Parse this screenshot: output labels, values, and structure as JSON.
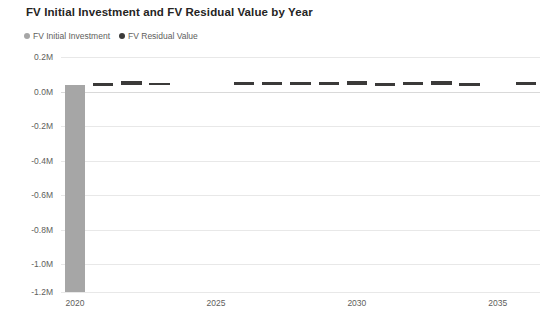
{
  "chart_data": {
    "type": "bar",
    "title": "FV Initial Investment and FV Residual Value by Year",
    "xlabel": "",
    "ylabel": "",
    "grid": true,
    "legend_position": "top-left",
    "categories": [
      "2020",
      "2021",
      "2022",
      "2023",
      "2024",
      "2025",
      "2026",
      "2027",
      "2028",
      "2029",
      "2030",
      "2031",
      "2032",
      "2033",
      "2034",
      "2035",
      "2036"
    ],
    "x_tick_labels": [
      "2020",
      "2025",
      "2030",
      "2035"
    ],
    "y_tick_labels": [
      "0.2M",
      "0.0M",
      "-0.2M",
      "-0.4M",
      "-0.6M",
      "-0.8M",
      "-1.0M",
      "-1.2M"
    ],
    "y_tick_values": [
      200000,
      0,
      -200000,
      -400000,
      -600000,
      -800000,
      -1000000,
      -1200000
    ],
    "ylim": [
      -1200000,
      200000
    ],
    "series": [
      {
        "name": "FV Initial Investment",
        "color": "#a6a6a6",
        "values": [
          -1200000,
          0,
          0,
          0,
          0,
          0,
          0,
          0,
          0,
          0,
          0,
          0,
          0,
          0,
          0,
          0,
          0
        ]
      },
      {
        "name": "FV Residual Value",
        "color": "#3b3a39",
        "values": [
          0,
          9000,
          22000,
          11000,
          0,
          0,
          15000,
          12000,
          16000,
          14000,
          21000,
          8000,
          15000,
          20000,
          7000,
          0,
          13000
        ]
      }
    ]
  },
  "legend": {
    "items": [
      {
        "label": "FV Initial Investment",
        "color": "#a6a6a6"
      },
      {
        "label": "FV Residual Value",
        "color": "#3b3a39"
      }
    ]
  }
}
